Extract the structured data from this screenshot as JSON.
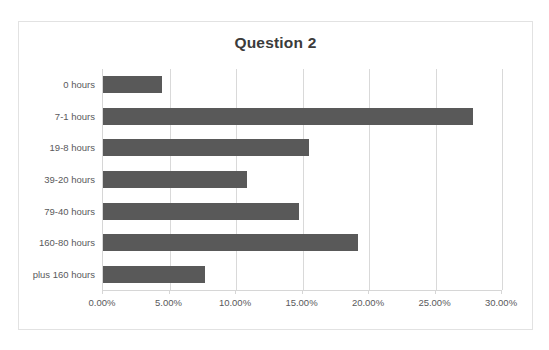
{
  "chart_data": {
    "type": "bar",
    "orientation": "horizontal",
    "title": "Question 2",
    "xlabel": "",
    "ylabel": "",
    "categories": [
      "0 hours",
      "7-1 hours",
      "19-8 hours",
      "39-20 hours",
      "79-40 hours",
      "160-80 hours",
      "plus 160 hours"
    ],
    "values": [
      4.4,
      27.8,
      15.5,
      10.8,
      14.7,
      19.2,
      7.7
    ],
    "value_labels": [
      "4.40%",
      "27.80%",
      "15.50%",
      "10.80%",
      "14.70%",
      "19.20%",
      "7.70%"
    ],
    "xlim": [
      0,
      30
    ],
    "xticks": [
      0,
      5,
      10,
      15,
      20,
      25,
      30
    ],
    "xtick_labels": [
      "0.00%",
      "5.00%",
      "10.00%",
      "15.00%",
      "20.00%",
      "25.00%",
      "30.00%"
    ],
    "grid": true,
    "grid_axis": "x",
    "legend": false,
    "legend_position": "none",
    "series": [
      {
        "name": "Question 2",
        "values": [
          4.4,
          27.8,
          15.5,
          10.8,
          14.7,
          19.2,
          7.7
        ]
      }
    ],
    "colors": {
      "bar": "#595959",
      "gridline": "#d9d9d9",
      "axis": "#d6d6d6",
      "title_text": "#3b3b3b",
      "label_text": "#59595b",
      "chart_border": "#e2e2e2",
      "background": "#ffffff"
    }
  }
}
